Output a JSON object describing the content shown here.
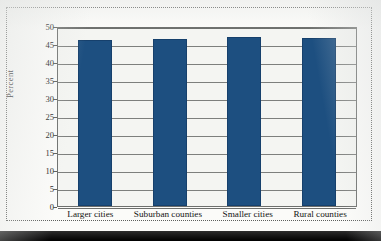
{
  "figure": {
    "background_color": "#fbfbf9",
    "frame_style": "dotted",
    "frame_color": "#5d5f5d"
  },
  "chart_data": {
    "type": "bar",
    "title": "",
    "subtitle": "",
    "xlabel": "",
    "ylabel": "Percent",
    "categories": [
      "Larger cities",
      "Suburban counties",
      "Smaller cities",
      "Rural counties"
    ],
    "values": [
      46.2,
      46.3,
      47.0,
      46.6
    ],
    "ylim": [
      0,
      50
    ],
    "yticks": [
      0,
      5,
      10,
      15,
      20,
      25,
      30,
      35,
      40,
      45,
      50
    ],
    "ytick_labels": [
      "0",
      "5",
      "10",
      "15",
      "20",
      "25",
      "30",
      "35",
      "40",
      "45",
      "50"
    ],
    "grid": true,
    "grid_axis": "y",
    "legend": false,
    "legend_position": "none",
    "bar_color": "#1d4f80",
    "plot_background": "#f4f5f2",
    "grid_color": "#7d7f7d",
    "axis_color": "#6d6f6d"
  }
}
